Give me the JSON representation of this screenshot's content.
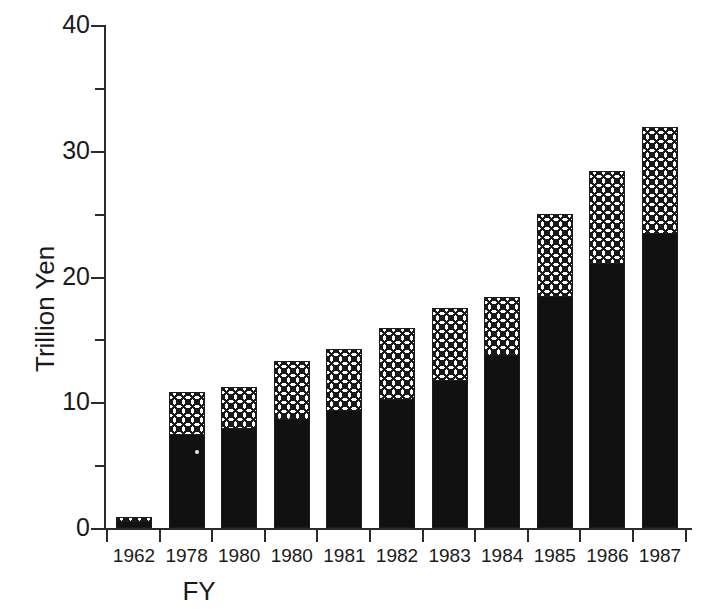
{
  "chart_data": {
    "type": "bar",
    "title": "",
    "subtitle": "",
    "xlabel": "FY",
    "ylabel": "Trillion Yen",
    "categories": [
      "1962",
      "1978",
      "1980",
      "1980",
      "1981",
      "1982",
      "1983",
      "1984",
      "1985",
      "1986",
      "1987"
    ],
    "stacked": true,
    "series": [
      {
        "name": "lower-solid-black",
        "values": [
          0.5,
          7.4,
          7.9,
          8.6,
          9.3,
          10.2,
          11.7,
          13.7,
          18.4,
          21.0,
          23.4
        ]
      },
      {
        "name": "upper-hatched",
        "values": [
          0.4,
          3.4,
          3.3,
          4.7,
          4.9,
          5.7,
          5.8,
          4.7,
          6.6,
          7.4,
          8.5
        ]
      }
    ],
    "totals": [
      0.9,
      10.8,
      11.2,
      13.3,
      14.2,
      15.9,
      17.5,
      18.4,
      25.0,
      28.4,
      31.9
    ],
    "ylim": [
      0,
      40
    ],
    "ymajor_ticks": [
      0,
      10,
      20,
      30,
      40
    ],
    "yminor_ticks": [
      5,
      15,
      25,
      35
    ],
    "ytick_labels": [
      "0",
      "10",
      "20",
      "30",
      "40"
    ],
    "grid": false,
    "legend": "none",
    "legend_position": "none"
  },
  "axes": {
    "y_label_text": "Trillion Yen",
    "x_label_text": "FY"
  }
}
